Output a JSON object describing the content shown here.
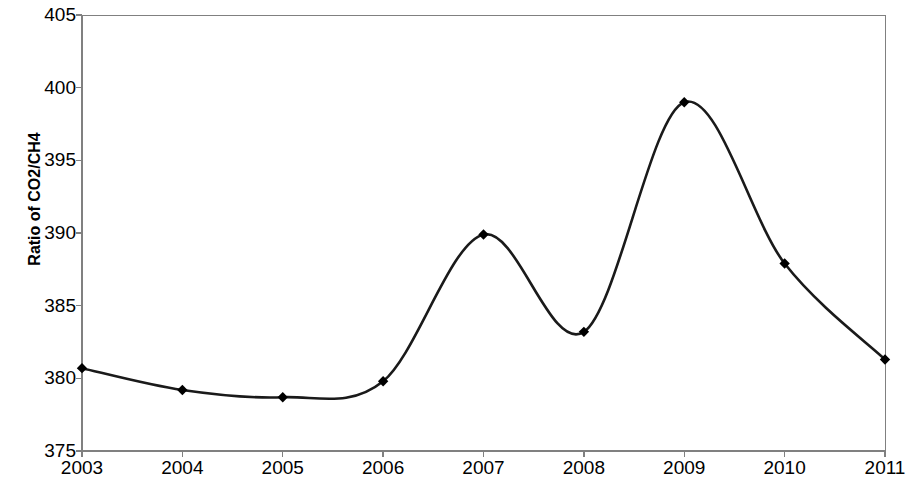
{
  "chart_data": {
    "type": "line",
    "title": "",
    "xlabel": "",
    "ylabel": "Ratio of CO2/CH4",
    "categories": [
      "2003",
      "2004",
      "2005",
      "2006",
      "2007",
      "2008",
      "2009",
      "2010",
      "2011"
    ],
    "x": [
      2003,
      2004,
      2005,
      2006,
      2007,
      2008,
      2009,
      2010,
      2011
    ],
    "values": [
      380.7,
      379.2,
      378.7,
      379.8,
      389.9,
      383.2,
      399.0,
      387.9,
      381.3
    ],
    "series": [
      {
        "name": "Ratio of CO2/CH4",
        "values": [
          380.7,
          379.2,
          378.7,
          379.8,
          389.9,
          383.2,
          399.0,
          387.9,
          381.3
        ]
      }
    ],
    "ylim": [
      375,
      405
    ],
    "ytick_labels": [
      "375",
      "380",
      "385",
      "390",
      "395",
      "400",
      "405"
    ],
    "yticks": [
      375,
      380,
      385,
      390,
      395,
      400,
      405
    ],
    "xlim": [
      2003,
      2011
    ],
    "grid": false,
    "legend": null,
    "legend_position": "none",
    "line_color": "#1a1a1a",
    "marker": "diamond",
    "marker_color": "#000000",
    "smoothing": "spline",
    "axis_color": "#808080",
    "background_color": "#ffffff"
  },
  "axes": {
    "y_title": "Ratio of CO2/CH4",
    "y_ticks": [
      {
        "label": "405",
        "value": 405
      },
      {
        "label": "400",
        "value": 400
      },
      {
        "label": "395",
        "value": 395
      },
      {
        "label": "390",
        "value": 390
      },
      {
        "label": "385",
        "value": 385
      },
      {
        "label": "380",
        "value": 380
      },
      {
        "label": "375",
        "value": 375
      }
    ],
    "x_ticks": [
      {
        "label": "2003",
        "value": 2003
      },
      {
        "label": "2004",
        "value": 2004
      },
      {
        "label": "2005",
        "value": 2005
      },
      {
        "label": "2006",
        "value": 2006
      },
      {
        "label": "2007",
        "value": 2007
      },
      {
        "label": "2008",
        "value": 2008
      },
      {
        "label": "2009",
        "value": 2009
      },
      {
        "label": "2010",
        "value": 2010
      },
      {
        "label": "2011",
        "value": 2011
      }
    ]
  }
}
